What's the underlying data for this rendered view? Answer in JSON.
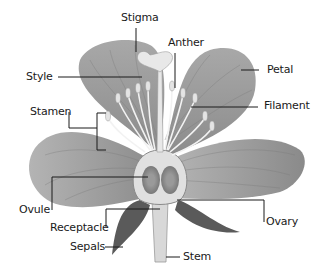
{
  "diagram": {
    "colors": {
      "petal": "#9a9a9a",
      "petal_light": "#c8c8c8",
      "stamen": "#efefef",
      "line": "#1a1a1a",
      "background": "#ffffff"
    },
    "labels": [
      {
        "id": "stigma",
        "text": "Stigma"
      },
      {
        "id": "anther",
        "text": "Anther"
      },
      {
        "id": "style",
        "text": "Style"
      },
      {
        "id": "petal",
        "text": "Petal"
      },
      {
        "id": "stamen",
        "text": "Stamen"
      },
      {
        "id": "filament",
        "text": "Filament"
      },
      {
        "id": "ovule",
        "text": "Ovule"
      },
      {
        "id": "receptacle",
        "text": "Receptacle"
      },
      {
        "id": "sepals",
        "text": "Sepals"
      },
      {
        "id": "ovary",
        "text": "Ovary"
      },
      {
        "id": "stem",
        "text": "Stem"
      }
    ]
  }
}
